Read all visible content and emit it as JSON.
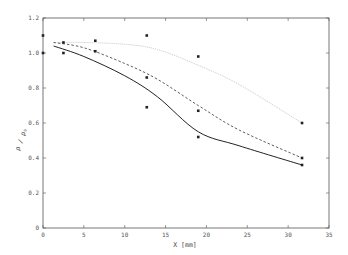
{
  "chart_data": {
    "type": "line",
    "title": "",
    "xlabel": "X [mm]",
    "ylabel": "ρ / ρ₀",
    "xlim": [
      0,
      35
    ],
    "ylim": [
      0,
      1.2
    ],
    "x_ticks": [
      0,
      5,
      10,
      15,
      20,
      25,
      30,
      35
    ],
    "y_ticks": [
      0,
      0.2,
      0.4,
      0.6,
      0.8,
      1.0,
      1.2
    ],
    "x_tick_labels": [
      "0",
      "5",
      "10",
      "15",
      "20",
      "25",
      "30",
      "35"
    ],
    "y_tick_labels": [
      "0",
      "0.2",
      "0.4",
      "0.6",
      "0.8",
      "1.0",
      "1.2"
    ],
    "grid": false,
    "legend": null,
    "series": [
      {
        "name": "dotted curve (upper)",
        "style": "dotted",
        "color": "#c8c8c8",
        "x": [
          1.3,
          5,
          10,
          14,
          19,
          24,
          31.7
        ],
        "y": [
          1.06,
          1.06,
          1.05,
          1.02,
          0.93,
          0.82,
          0.6
        ]
      },
      {
        "name": "dashed curve (middle)",
        "style": "dashed",
        "color": "#333333",
        "x": [
          1.3,
          5,
          10,
          14,
          19,
          24,
          31.7
        ],
        "y": [
          1.06,
          1.03,
          0.94,
          0.85,
          0.7,
          0.56,
          0.4
        ]
      },
      {
        "name": "solid curve (lower)",
        "style": "solid",
        "color": "#222222",
        "x": [
          1.3,
          5,
          10,
          14,
          19,
          24,
          31.7
        ],
        "y": [
          1.04,
          0.98,
          0.87,
          0.75,
          0.55,
          0.47,
          0.36
        ]
      },
      {
        "name": "measured points",
        "style": "markers",
        "color": "#222222",
        "x": [
          0,
          0,
          2.5,
          2.5,
          6.4,
          6.4,
          12.7,
          12.7,
          12.7,
          19.0,
          19.0,
          19.0,
          31.7,
          31.7,
          31.7
        ],
        "y": [
          1.1,
          1.0,
          1.06,
          1.0,
          1.07,
          1.01,
          1.1,
          0.86,
          0.69,
          0.98,
          0.67,
          0.52,
          0.6,
          0.4,
          0.36
        ]
      }
    ]
  }
}
